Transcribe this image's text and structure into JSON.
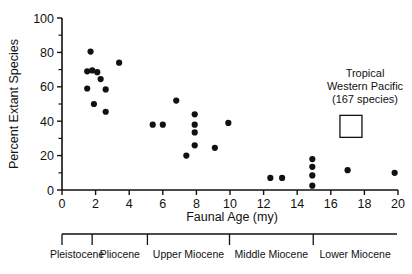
{
  "chart_data": {
    "type": "scatter",
    "title": "",
    "xlabel": "Faunal Age (my)",
    "ylabel": "Percent Extant Species",
    "xlim": [
      0,
      20
    ],
    "ylim": [
      0,
      100
    ],
    "xticks": [
      0,
      2,
      4,
      6,
      8,
      10,
      12,
      14,
      16,
      18,
      20
    ],
    "xticklabels": [
      "0",
      "2",
      "4",
      "6",
      "8",
      "10",
      "12",
      "14",
      "16",
      "18",
      "20"
    ],
    "yticks": [
      0,
      20,
      40,
      60,
      80,
      100
    ],
    "yticklabels": [
      "0",
      "20",
      "40",
      "60",
      "80",
      "100"
    ],
    "y_minor_ticks": [
      10,
      30,
      50,
      70,
      90
    ],
    "grid": false,
    "legend": false,
    "marker": "filled-circle",
    "marker_color": "#111111",
    "points": [
      {
        "x": 1.7,
        "y": 80.5
      },
      {
        "x": 1.5,
        "y": 69.0
      },
      {
        "x": 1.8,
        "y": 69.5
      },
      {
        "x": 2.1,
        "y": 68.5
      },
      {
        "x": 3.4,
        "y": 74.0
      },
      {
        "x": 2.3,
        "y": 64.5
      },
      {
        "x": 1.5,
        "y": 59.0
      },
      {
        "x": 2.6,
        "y": 58.5
      },
      {
        "x": 1.9,
        "y": 50.0
      },
      {
        "x": 2.6,
        "y": 45.5
      },
      {
        "x": 5.4,
        "y": 38.0
      },
      {
        "x": 6.0,
        "y": 38.0
      },
      {
        "x": 6.8,
        "y": 52.0
      },
      {
        "x": 7.4,
        "y": 20.0
      },
      {
        "x": 7.9,
        "y": 44.0
      },
      {
        "x": 7.9,
        "y": 38.0
      },
      {
        "x": 7.9,
        "y": 33.5
      },
      {
        "x": 7.9,
        "y": 26.0
      },
      {
        "x": 9.1,
        "y": 24.5
      },
      {
        "x": 9.9,
        "y": 39.0
      },
      {
        "x": 12.4,
        "y": 7.0
      },
      {
        "x": 13.1,
        "y": 7.0
      },
      {
        "x": 14.9,
        "y": 18.0
      },
      {
        "x": 14.9,
        "y": 13.5
      },
      {
        "x": 14.9,
        "y": 8.5
      },
      {
        "x": 14.9,
        "y": 2.5
      },
      {
        "x": 17.0,
        "y": 11.5
      },
      {
        "x": 19.8,
        "y": 10.0
      }
    ],
    "annotation": {
      "lines": [
        "Tropical",
        "Western Pacific",
        "(167 species)"
      ],
      "marker": "open-square",
      "marker_x": 17.2,
      "marker_y": 37.0
    },
    "epoch_scale": {
      "label": "",
      "boundaries_my": [
        0.0,
        1.8,
        5.1,
        10.0,
        15.0,
        20.0
      ],
      "epochs": [
        {
          "name": "Pleistocene",
          "start": 0.0,
          "end": 1.8
        },
        {
          "name": "Pliocene",
          "start": 1.8,
          "end": 5.1
        },
        {
          "name": "Upper Miocene",
          "start": 5.1,
          "end": 10.0
        },
        {
          "name": "Middle Miocene",
          "start": 10.0,
          "end": 15.0
        },
        {
          "name": "Lower Miocene",
          "start": 15.0,
          "end": 20.0
        }
      ]
    }
  }
}
